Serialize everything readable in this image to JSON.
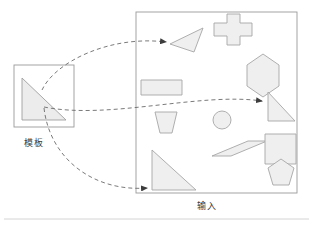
{
  "figure": {
    "type": "diagram",
    "background": "#ffffff",
    "stroke_color": "#8c8c8c",
    "shape_fill": "#efefef",
    "shape_stroke": "#a6a6a6",
    "arrow_color": "#6b6b6b",
    "text_color": "#3a3a3a",
    "frame_bottom_rule": true
  },
  "panels": {
    "template": {
      "label": "模板",
      "box": {
        "x": 14,
        "y": 65,
        "w": 60,
        "h": 62
      },
      "shape": {
        "name": "right-triangle",
        "points": "22,78 22,120 66,120",
        "right_angle_corner": "bottom-left"
      }
    },
    "input": {
      "label": "输入",
      "box": {
        "x": 136,
        "y": 12,
        "w": 161,
        "h": 181
      }
    }
  },
  "shapes": [
    {
      "id": "rotated-triangle",
      "name": "triangle-rotated",
      "points": "170,44 203,28 194,52"
    },
    {
      "id": "cross",
      "name": "cross-plus",
      "points": "214,23 227,23 227,14 240,14 240,23 252,23 252,36 240,36 240,45 227,45 227,36 214,36"
    },
    {
      "id": "hexagon",
      "name": "hexagon-vertical",
      "points": "247,65 263,54 279,65 279,86 263,97 247,86"
    },
    {
      "id": "rectangle",
      "name": "rectangle",
      "points": "141,80 182,80 182,95 141,95"
    },
    {
      "id": "right-triangle-matched",
      "name": "right-triangle-small",
      "points": "268,92 268,121 295,121"
    },
    {
      "id": "trapezoid",
      "name": "trapezoid",
      "points": "155,112 177,112 172,133 160,133"
    },
    {
      "id": "circle",
      "name": "circle",
      "cx": 222,
      "cy": 120,
      "r": 9
    },
    {
      "id": "parallelogram",
      "name": "parallelogram",
      "points": "212,156 248,141 267,141 231,156"
    },
    {
      "id": "square",
      "name": "square",
      "points": "265,134 296,134 296,164 265,164"
    },
    {
      "id": "big-right-triangle",
      "name": "right-triangle-large",
      "points": "152,150 152,190 196,190"
    },
    {
      "id": "pentagon",
      "name": "pentagon",
      "points": "268,168 281,159 294,168 289,185 273,185"
    }
  ],
  "arrows": [
    {
      "id": "arrow-top",
      "name": "match-arrow-to-rotated-triangle",
      "from": "template-triangle",
      "to": "rotated-triangle",
      "path": "M 42,90 C 55,62 110,35 166,42",
      "style": "dashed"
    },
    {
      "id": "arrow-middle",
      "name": "match-arrow-to-small-right-triangle",
      "from": "template-triangle",
      "to": "right-triangle-matched",
      "path": "M 44,107 C 110,120 200,92 264,101",
      "style": "dashed"
    },
    {
      "id": "arrow-bottom",
      "name": "match-arrow-to-large-right-triangle",
      "from": "template-triangle",
      "to": "big-right-triangle",
      "path": "M 44,108 C 50,160 95,192 148,188",
      "style": "dashed"
    }
  ]
}
